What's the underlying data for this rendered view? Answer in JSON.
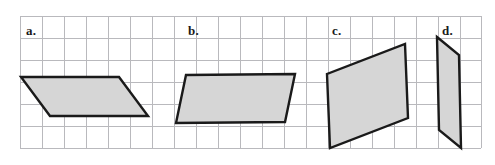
{
  "figure": {
    "width": 495,
    "height": 165,
    "background_color": "#ffffff"
  },
  "grid": {
    "line_color": "#b9b9bd",
    "line_width": 1,
    "spacing": 22,
    "x_start": 20,
    "x_end": 481,
    "y_start": 16,
    "y_end": 148,
    "vertical_x": [
      20,
      42,
      64,
      86,
      108,
      130,
      152,
      174,
      196,
      218,
      240,
      262,
      284,
      306,
      328,
      350,
      372,
      394,
      416,
      438,
      460,
      481
    ],
    "horizontal_y": [
      16,
      38,
      60,
      82,
      104,
      126,
      148
    ]
  },
  "style": {
    "shape_fill": "#d6d6d6",
    "shape_stroke": "#1a1a1a",
    "shape_stroke_width": 2.4,
    "label_color": "#1a1a1a"
  },
  "shapes": [
    {
      "id": "a",
      "label": "a.",
      "label_x": 26,
      "label_y": 24,
      "type": "parallelogram",
      "points": "21,77 119,77 148,116 50,116",
      "vertices": [
        [
          21,
          77
        ],
        [
          119,
          77
        ],
        [
          148,
          116
        ],
        [
          50,
          116
        ]
      ]
    },
    {
      "id": "b",
      "label": "b.",
      "label_x": 188,
      "label_y": 24,
      "type": "parallelogram",
      "points": "186,75 295,74 285,122 176,123",
      "vertices": [
        [
          186,
          75
        ],
        [
          295,
          74
        ],
        [
          285,
          122
        ],
        [
          176,
          123
        ]
      ]
    },
    {
      "id": "c",
      "label": "c.",
      "label_x": 332,
      "label_y": 24,
      "type": "parallelogram",
      "points": "405,44 408,118 330,148 327,74",
      "vertices": [
        [
          405,
          44
        ],
        [
          408,
          118
        ],
        [
          330,
          148
        ],
        [
          327,
          74
        ]
      ]
    },
    {
      "id": "d",
      "label": "d.",
      "label_x": 442,
      "label_y": 24,
      "type": "parallelogram",
      "points": "437,37 459,55 461,148 439,130",
      "vertices": [
        [
          437,
          37
        ],
        [
          459,
          55
        ],
        [
          461,
          148
        ],
        [
          439,
          130
        ]
      ]
    }
  ]
}
